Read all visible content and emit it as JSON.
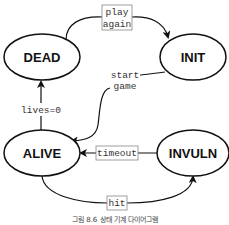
{
  "diagram": {
    "type": "state-machine",
    "states": [
      {
        "id": "dead",
        "label": "DEAD"
      },
      {
        "id": "init",
        "label": "INIT"
      },
      {
        "id": "alive",
        "label": "ALIVE"
      },
      {
        "id": "invuln",
        "label": "INVULN"
      }
    ],
    "transitions": [
      {
        "from": "DEAD",
        "to": "INIT",
        "label_line1": "play",
        "label_line2": "again"
      },
      {
        "from": "INIT",
        "to": "ALIVE",
        "label_line1": "start",
        "label_line2": "game"
      },
      {
        "from": "ALIVE",
        "to": "DEAD",
        "label": "lives=0"
      },
      {
        "from": "INVULN",
        "to": "ALIVE",
        "label": "timeout"
      },
      {
        "from": "ALIVE",
        "to": "INVULN",
        "label": "hit"
      }
    ],
    "caption": "그림 8.6 상태 기계 다이어그램"
  },
  "colors": {
    "stroke": "#111111",
    "background": "#ffffff",
    "label_box": "#888888"
  }
}
